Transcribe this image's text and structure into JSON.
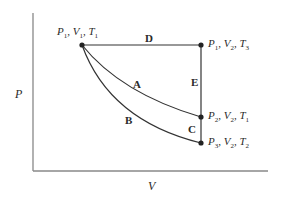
{
  "diagram": {
    "type": "P-V thermodynamic process diagram",
    "axes": {
      "y_label": "P",
      "x_label": "V"
    },
    "points": [
      {
        "id": "state-1",
        "P": "P",
        "P_sub": "1",
        "V": "V",
        "V_sub": "1",
        "T": "T",
        "T_sub": "1"
      },
      {
        "id": "state-top-right",
        "P": "P",
        "P_sub": "1",
        "V": "V",
        "V_sub": "2",
        "T": "T",
        "T_sub": "3"
      },
      {
        "id": "state-2",
        "P": "P",
        "P_sub": "2",
        "V": "V",
        "V_sub": "2",
        "T": "T",
        "T_sub": "1"
      },
      {
        "id": "state-3",
        "P": "P",
        "P_sub": "3",
        "V": "V",
        "V_sub": "2",
        "T": "T",
        "T_sub": "2"
      }
    ],
    "paths": [
      {
        "label": "A",
        "from": "P1,V1,T1",
        "to": "P2,V2,T1",
        "shape": "curve (isotherm)"
      },
      {
        "label": "B",
        "from": "P1,V1,T1",
        "to": "P3,V2,T2",
        "shape": "curve (steeper)"
      },
      {
        "label": "C",
        "from": "P2,V2,T1",
        "to": "P3,V2,T2",
        "shape": "vertical"
      },
      {
        "label": "D",
        "from": "P1,V1,T1",
        "to": "P1,V2,T3",
        "shape": "horizontal"
      },
      {
        "label": "E",
        "from": "P1,V2,T3",
        "to": "P2,V2,T1",
        "shape": "vertical"
      }
    ],
    "colors": {
      "line": "#333333",
      "axis": "#888888",
      "text": "#2a2a2a"
    }
  }
}
